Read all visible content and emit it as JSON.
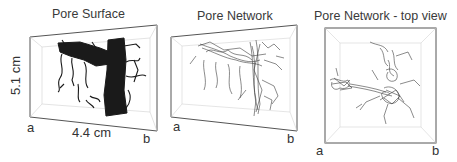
{
  "panels": [
    {
      "title": "Pore Surface",
      "corner_a": "a",
      "corner_b": "b",
      "height_label": "5.1 cm",
      "width_label": "4.4 cm"
    },
    {
      "title": "Pore Network",
      "corner_a": "a",
      "corner_b": "b"
    },
    {
      "title": "Pore Network - top view",
      "corner_a": "a",
      "corner_b": "b"
    }
  ],
  "colors": {
    "surface": "#1a1a1a",
    "network": "#3c3c3c",
    "box_edge": "#555555",
    "inner_edge": "#c8c8c8"
  }
}
